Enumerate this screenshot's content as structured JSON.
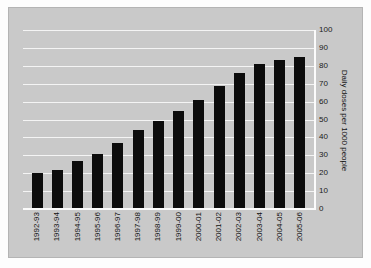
{
  "chart_data": {
    "type": "bar",
    "title": "",
    "subtitle": "",
    "xlabel": "",
    "ylabel": "Daily doses per 1000 people",
    "ylim": [
      0,
      100
    ],
    "yticks": [
      0,
      10,
      20,
      30,
      40,
      50,
      60,
      70,
      80,
      90,
      100
    ],
    "grid": true,
    "legend": false,
    "legend_position": "none",
    "categories": [
      "1992-93",
      "1993-94",
      "1994-95",
      "1995-96",
      "1996-97",
      "1997-98",
      "1998-99",
      "1999-00",
      "2000-01",
      "2001-02",
      "2002-03",
      "2003-04",
      "2004-05",
      "2005-06"
    ],
    "values": [
      20,
      22,
      27,
      31,
      37,
      44,
      49,
      55,
      61,
      69,
      76,
      81,
      83,
      85
    ],
    "bar_color": "#0c0c0c",
    "plot_background": "#c9c9c9",
    "gridline_color": "#f4f4f4",
    "axis_color": "#fbfbfb"
  }
}
